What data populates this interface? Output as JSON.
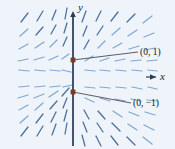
{
  "figure": {
    "kind": "slope-field",
    "background_color": "#eef4fa",
    "width": 175,
    "height": 149
  },
  "axes": {
    "x_label": "x",
    "y_label": "y",
    "x_axis_color_left": "#6a62c8",
    "x_axis_color_mid": "#a8a24a",
    "x_axis_color_right": "#cfc98a",
    "y_axis_color": "#3b4a63",
    "origin_x": 73,
    "origin_y": 77
  },
  "equilibria": [
    {
      "label": "(0, 1)",
      "marker_color": "#7b3b22",
      "x": 73,
      "y": 60,
      "leader_to_x": 138,
      "leader_to_y": 52
    },
    {
      "label": "(0, −1)",
      "marker_color": "#7b3b22",
      "x": 73,
      "y": 92,
      "leader_to_x": 131,
      "leader_to_y": 103
    }
  ],
  "slope_field": {
    "segment_color": "#7fa8d4",
    "segment_color_dark": "#4a6e9e",
    "description": "Short line segments showing direction field with horizontal equilibrium solutions at y = 1 and y = -1",
    "segments": [
      {
        "x": 21,
        "y": 22,
        "dx": 7,
        "dy": -9
      },
      {
        "x": 37,
        "y": 21,
        "dx": 6,
        "dy": -10
      },
      {
        "x": 52,
        "y": 20,
        "dx": 4,
        "dy": -10
      },
      {
        "x": 65,
        "y": 19,
        "dx": 2,
        "dy": -11
      },
      {
        "x": 20,
        "y": 36,
        "dx": 8,
        "dy": -7
      },
      {
        "x": 36,
        "y": 35,
        "dx": 7,
        "dy": -8
      },
      {
        "x": 51,
        "y": 34,
        "dx": 5,
        "dy": -9
      },
      {
        "x": 64,
        "y": 33,
        "dx": 3,
        "dy": -10
      },
      {
        "x": 19,
        "y": 49,
        "dx": 9,
        "dy": -5
      },
      {
        "x": 35,
        "y": 48,
        "dx": 9,
        "dy": -6
      },
      {
        "x": 50,
        "y": 47,
        "dx": 7,
        "dy": -7
      },
      {
        "x": 63,
        "y": 46,
        "dx": 4,
        "dy": -9
      },
      {
        "x": 18,
        "y": 61,
        "dx": 10,
        "dy": -2
      },
      {
        "x": 34,
        "y": 60,
        "dx": 10,
        "dy": -3
      },
      {
        "x": 49,
        "y": 60,
        "dx": 9,
        "dy": -4
      },
      {
        "x": 62,
        "y": 59,
        "dx": 7,
        "dy": -5
      },
      {
        "x": 19,
        "y": 70,
        "dx": 10,
        "dy": 1
      },
      {
        "x": 35,
        "y": 70,
        "dx": 10,
        "dy": 1
      },
      {
        "x": 50,
        "y": 70,
        "dx": 10,
        "dy": 1
      },
      {
        "x": 62,
        "y": 70,
        "dx": 9,
        "dy": 2
      },
      {
        "x": 82,
        "y": 22,
        "dx": 4,
        "dy": -11
      },
      {
        "x": 96,
        "y": 21,
        "dx": 5,
        "dy": -10
      },
      {
        "x": 111,
        "y": 21,
        "dx": 7,
        "dy": -9
      },
      {
        "x": 127,
        "y": 22,
        "dx": 8,
        "dy": -8
      },
      {
        "x": 143,
        "y": 23,
        "dx": 9,
        "dy": -7
      },
      {
        "x": 83,
        "y": 36,
        "dx": 4,
        "dy": -10
      },
      {
        "x": 97,
        "y": 35,
        "dx": 6,
        "dy": -9
      },
      {
        "x": 112,
        "y": 35,
        "dx": 8,
        "dy": -7
      },
      {
        "x": 128,
        "y": 36,
        "dx": 9,
        "dy": -6
      },
      {
        "x": 144,
        "y": 37,
        "dx": 10,
        "dy": -4
      },
      {
        "x": 84,
        "y": 49,
        "dx": 5,
        "dy": -9
      },
      {
        "x": 98,
        "y": 48,
        "dx": 7,
        "dy": -7
      },
      {
        "x": 113,
        "y": 48,
        "dx": 9,
        "dy": -5
      },
      {
        "x": 129,
        "y": 49,
        "dx": 10,
        "dy": -3
      },
      {
        "x": 145,
        "y": 50,
        "dx": 10,
        "dy": -2
      },
      {
        "x": 85,
        "y": 61,
        "dx": 8,
        "dy": -5
      },
      {
        "x": 100,
        "y": 61,
        "dx": 9,
        "dy": -3
      },
      {
        "x": 115,
        "y": 61,
        "dx": 10,
        "dy": -2
      },
      {
        "x": 131,
        "y": 61,
        "dx": 10,
        "dy": -1
      },
      {
        "x": 147,
        "y": 61,
        "dx": 10,
        "dy": -1
      },
      {
        "x": 85,
        "y": 70,
        "dx": 10,
        "dy": 1
      },
      {
        "x": 100,
        "y": 70,
        "dx": 10,
        "dy": 1
      },
      {
        "x": 116,
        "y": 70,
        "dx": 10,
        "dy": 1
      },
      {
        "x": 132,
        "y": 70,
        "dx": 10,
        "dy": 1
      },
      {
        "x": 148,
        "y": 70,
        "dx": 9,
        "dy": 1
      },
      {
        "x": 19,
        "y": 87,
        "dx": 10,
        "dy": -1
      },
      {
        "x": 35,
        "y": 87,
        "dx": 10,
        "dy": -1
      },
      {
        "x": 50,
        "y": 87,
        "dx": 10,
        "dy": -1
      },
      {
        "x": 63,
        "y": 87,
        "dx": 9,
        "dy": -2
      },
      {
        "x": 18,
        "y": 98,
        "dx": 10,
        "dy": -3
      },
      {
        "x": 34,
        "y": 98,
        "dx": 10,
        "dy": -4
      },
      {
        "x": 49,
        "y": 97,
        "dx": 9,
        "dy": -6
      },
      {
        "x": 62,
        "y": 96,
        "dx": 7,
        "dy": -8
      },
      {
        "x": 19,
        "y": 110,
        "dx": 9,
        "dy": -5
      },
      {
        "x": 35,
        "y": 110,
        "dx": 8,
        "dy": -7
      },
      {
        "x": 50,
        "y": 109,
        "dx": 7,
        "dy": -8
      },
      {
        "x": 63,
        "y": 108,
        "dx": 4,
        "dy": -10
      },
      {
        "x": 20,
        "y": 123,
        "dx": 8,
        "dy": -7
      },
      {
        "x": 36,
        "y": 123,
        "dx": 7,
        "dy": -9
      },
      {
        "x": 51,
        "y": 122,
        "dx": 5,
        "dy": -10
      },
      {
        "x": 64,
        "y": 121,
        "dx": 3,
        "dy": -11
      },
      {
        "x": 21,
        "y": 136,
        "dx": 7,
        "dy": -9
      },
      {
        "x": 37,
        "y": 136,
        "dx": 6,
        "dy": -10
      },
      {
        "x": 52,
        "y": 135,
        "dx": 4,
        "dy": -11
      },
      {
        "x": 65,
        "y": 134,
        "dx": 2,
        "dy": -11
      },
      {
        "x": 85,
        "y": 87,
        "dx": 10,
        "dy": 1
      },
      {
        "x": 100,
        "y": 87,
        "dx": 10,
        "dy": 1
      },
      {
        "x": 116,
        "y": 87,
        "dx": 10,
        "dy": 1
      },
      {
        "x": 132,
        "y": 87,
        "dx": 10,
        "dy": 2
      },
      {
        "x": 148,
        "y": 87,
        "dx": 9,
        "dy": 2
      },
      {
        "x": 85,
        "y": 98,
        "dx": 9,
        "dy": 4
      },
      {
        "x": 100,
        "y": 98,
        "dx": 10,
        "dy": 3
      },
      {
        "x": 115,
        "y": 99,
        "dx": 10,
        "dy": 2
      },
      {
        "x": 131,
        "y": 99,
        "dx": 10,
        "dy": 2
      },
      {
        "x": 147,
        "y": 100,
        "dx": 10,
        "dy": 1
      },
      {
        "x": 84,
        "y": 110,
        "dx": 5,
        "dy": 9
      },
      {
        "x": 98,
        "y": 111,
        "dx": 7,
        "dy": 8
      },
      {
        "x": 113,
        "y": 111,
        "dx": 9,
        "dy": 6
      },
      {
        "x": 129,
        "y": 112,
        "dx": 10,
        "dy": 4
      },
      {
        "x": 145,
        "y": 112,
        "dx": 10,
        "dy": 3
      },
      {
        "x": 83,
        "y": 122,
        "dx": 4,
        "dy": 10
      },
      {
        "x": 97,
        "y": 123,
        "dx": 6,
        "dy": 9
      },
      {
        "x": 112,
        "y": 123,
        "dx": 8,
        "dy": 8
      },
      {
        "x": 128,
        "y": 124,
        "dx": 9,
        "dy": 6
      },
      {
        "x": 144,
        "y": 125,
        "dx": 10,
        "dy": 5
      },
      {
        "x": 82,
        "y": 135,
        "dx": 3,
        "dy": 11
      },
      {
        "x": 96,
        "y": 136,
        "dx": 5,
        "dy": 10
      },
      {
        "x": 111,
        "y": 136,
        "dx": 7,
        "dy": 9
      },
      {
        "x": 127,
        "y": 137,
        "dx": 8,
        "dy": 8
      },
      {
        "x": 143,
        "y": 137,
        "dx": 9,
        "dy": 7
      }
    ]
  }
}
